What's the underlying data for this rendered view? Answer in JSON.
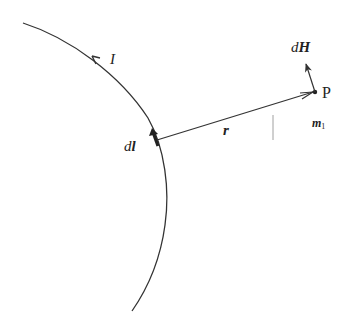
{
  "diagram": {
    "type": "Biot-Savart law illustration",
    "colors": {
      "stroke": "#333333",
      "background": "#ffffff"
    },
    "labels": {
      "current": "I",
      "current_element_d": "d",
      "current_element_l": "l",
      "position_vector": "r",
      "point": "P",
      "field_element_d": "d",
      "field_element_H": "H",
      "point_marker_m": "m",
      "point_marker_sub": "1"
    },
    "elements": [
      {
        "id": "wire",
        "kind": "curved conductor arc"
      },
      {
        "id": "current-arrow",
        "kind": "arrowhead on wire indicating current direction"
      },
      {
        "id": "dl-vector",
        "kind": "thick short arrow along wire"
      },
      {
        "id": "r-vector",
        "kind": "arrow from dl to P"
      },
      {
        "id": "point-P",
        "kind": "dot"
      },
      {
        "id": "dH-vector",
        "kind": "arrow from P"
      },
      {
        "id": "tick-mark",
        "kind": "short vertical line"
      }
    ]
  }
}
